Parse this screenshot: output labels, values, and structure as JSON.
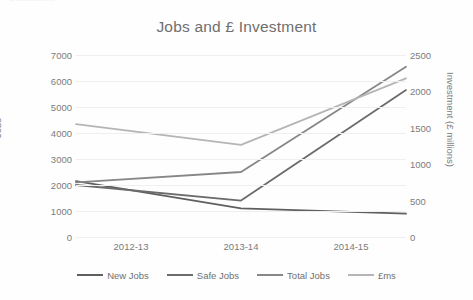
{
  "top_artifact_text": "................",
  "chart_data": {
    "type": "line",
    "title": "Jobs and £ Investment",
    "xlabel": "",
    "ylabel": "Jobs",
    "y2label": "Investment (£ millions)",
    "categories": [
      "2012-13",
      "2013-14",
      "2014-15"
    ],
    "ylim": [
      0,
      7000
    ],
    "yticks": [
      "7000",
      "6000",
      "5000",
      "4000",
      "3000",
      "2000",
      "1000",
      "0"
    ],
    "y2lim": [
      0,
      2500
    ],
    "y2ticks": [
      "2500",
      "2000",
      "1500",
      "1000",
      "500",
      "0"
    ],
    "grid": true,
    "legend_position": "bottom",
    "series": [
      {
        "name": "New Jobs",
        "axis": "left",
        "color": "#5f5f5f",
        "values": [
          2150,
          1100,
          900
        ]
      },
      {
        "name": "Safe Jobs",
        "axis": "left",
        "color": "#6b6b6b",
        "values": [
          2000,
          1400,
          5650
        ]
      },
      {
        "name": "Total Jobs",
        "axis": "left",
        "color": "#878787",
        "values": [
          2100,
          2500,
          6550
        ]
      },
      {
        "name": "£ms",
        "axis": "right",
        "color": "#b5b5b5",
        "values": [
          1550,
          1265,
          2180
        ]
      }
    ]
  }
}
